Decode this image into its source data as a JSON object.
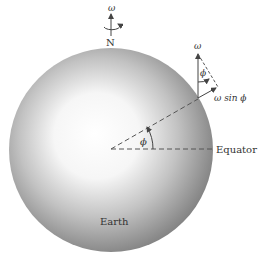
{
  "diagram": {
    "omega_top_label": "ω",
    "north_label": "N",
    "omega_vector_label": "ω",
    "phi_small_label": "ϕ",
    "omega_sin_phi_label": "ω sin ϕ",
    "phi_center_label": "ϕ",
    "equator_label": "Equator",
    "earth_label": "Earth"
  },
  "colors": {
    "sphere_center": "#ffffff",
    "sphere_edge": "#7a7a7a",
    "line": "#555555",
    "text": "#333333"
  }
}
